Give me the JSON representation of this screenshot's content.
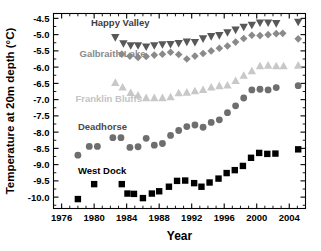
{
  "chart_data": {
    "type": "scatter",
    "title": "",
    "xlabel": "Year",
    "ylabel": "Temperature at 20m depth (°C)",
    "xlim": [
      1975.0,
      2006.0
    ],
    "ylim": [
      -10.35,
      -4.35
    ],
    "xticks": [
      1976,
      1980,
      1984,
      1988,
      1992,
      1996,
      2000,
      2004
    ],
    "yticks": [
      -4.5,
      -5.0,
      -5.5,
      -6.0,
      -6.5,
      -7.0,
      -7.5,
      -8.0,
      -8.5,
      -9.0,
      -9.5,
      -10.0
    ],
    "xtick_labels": [
      "1976",
      "1980",
      "1984",
      "1988",
      "1992",
      "1996",
      "2000",
      "2004"
    ],
    "ytick_labels": [
      "-4.5",
      "-5.0",
      "-5.5",
      "-6.0",
      "-6.5",
      "-7.0",
      "-7.5",
      "-8.0",
      "-8.5",
      "-9.0",
      "-9.5",
      "-10.0"
    ],
    "grid": false,
    "legend_position": "inline-annotations",
    "minor_ticks": true,
    "series": [
      {
        "name": "Happy Valley",
        "marker": "triangle-down",
        "color": "#585858",
        "label_color": "#404040",
        "label_x": 1979.6,
        "label_y": -4.72,
        "points": [
          [
            1982.6,
            -5.08
          ],
          [
            1983.6,
            -5.27
          ],
          [
            1984.5,
            -5.33
          ],
          [
            1985.4,
            -5.33
          ],
          [
            1986.4,
            -5.37
          ],
          [
            1987.4,
            -5.33
          ],
          [
            1988.4,
            -5.3
          ],
          [
            1989.4,
            -5.29
          ],
          [
            1990.4,
            -5.26
          ],
          [
            1991.4,
            -5.22
          ],
          [
            1992.4,
            -5.23
          ],
          [
            1993.4,
            -5.12
          ],
          [
            1994.4,
            -5.05
          ],
          [
            1995.4,
            -5.02
          ],
          [
            1996.4,
            -4.93
          ],
          [
            1997.4,
            -4.85
          ],
          [
            1998.4,
            -4.76
          ],
          [
            1999.4,
            -4.7
          ],
          [
            2000.4,
            -4.63
          ],
          [
            2001.4,
            -4.63
          ],
          [
            2002.4,
            -4.65
          ],
          [
            2005.1,
            -4.61
          ]
        ]
      },
      {
        "name": "Galbraith Lake",
        "marker": "diamond",
        "color": "#8a8a8a",
        "label_color": "#8a8a8a",
        "label_x": 1978.2,
        "label_y": -5.7,
        "points": [
          [
            1983.4,
            -5.6
          ],
          [
            1984.4,
            -5.66
          ],
          [
            1985.4,
            -5.7
          ],
          [
            1986.4,
            -5.67
          ],
          [
            1987.4,
            -5.63
          ],
          [
            1988.4,
            -5.6
          ],
          [
            1989.4,
            -5.54
          ],
          [
            1990.4,
            -5.61
          ],
          [
            1991.4,
            -5.75
          ],
          [
            1992.4,
            -5.66
          ],
          [
            1993.4,
            -5.58
          ],
          [
            1994.4,
            -5.5
          ],
          [
            1995.4,
            -5.42
          ],
          [
            1996.4,
            -5.35
          ],
          [
            1997.4,
            -5.23
          ],
          [
            1998.4,
            -5.12
          ],
          [
            1999.4,
            -5.02
          ],
          [
            2000.4,
            -5.03
          ],
          [
            2001.4,
            -5.0
          ],
          [
            2002.4,
            -4.97
          ],
          [
            2003.2,
            -4.96
          ],
          [
            2005.1,
            -5.13
          ]
        ]
      },
      {
        "name": "Franklin Bluffs",
        "marker": "triangle-up",
        "color": "#c8c8c8",
        "label_color": "#c4c4c4",
        "label_x": 1977.7,
        "label_y": -7.08,
        "points": [
          [
            1982.6,
            -6.48
          ],
          [
            1983.5,
            -6.62
          ],
          [
            1984.5,
            -6.79
          ],
          [
            1985.4,
            -6.87
          ],
          [
            1986.4,
            -6.95
          ],
          [
            1987.4,
            -6.95
          ],
          [
            1988.4,
            -6.95
          ],
          [
            1989.4,
            -6.92
          ],
          [
            1990.4,
            -6.8
          ],
          [
            1991.4,
            -6.78
          ],
          [
            1992.4,
            -6.74
          ],
          [
            1993.4,
            -6.7
          ],
          [
            1994.4,
            -6.62
          ],
          [
            1995.4,
            -6.58
          ],
          [
            1996.4,
            -6.56
          ],
          [
            1997.4,
            -6.42
          ],
          [
            1998.4,
            -6.26
          ],
          [
            1999.4,
            -6.12
          ],
          [
            2000.4,
            -5.97
          ],
          [
            2001.4,
            -5.95
          ],
          [
            2002.4,
            -5.97
          ],
          [
            2003.3,
            -5.97
          ],
          [
            2005.1,
            -5.95
          ]
        ]
      },
      {
        "name": "Deadhorse",
        "marker": "circle",
        "color": "#6e6e6e",
        "label_color": "#4a4a4a",
        "label_x": 1978.0,
        "label_y": -7.93,
        "points": [
          [
            1978.0,
            -8.71
          ],
          [
            1979.4,
            -8.44
          ],
          [
            1980.4,
            -8.44
          ],
          [
            1982.3,
            -8.17
          ],
          [
            1983.3,
            -8.17
          ],
          [
            1984.4,
            -8.47
          ],
          [
            1985.4,
            -8.45
          ],
          [
            1986.4,
            -8.19
          ],
          [
            1987.4,
            -8.4
          ],
          [
            1988.4,
            -8.35
          ],
          [
            1989.4,
            -8.1
          ],
          [
            1990.4,
            -7.95
          ],
          [
            1991.4,
            -7.83
          ],
          [
            1992.4,
            -7.78
          ],
          [
            1993.4,
            -7.85
          ],
          [
            1994.4,
            -7.7
          ],
          [
            1995.4,
            -7.62
          ],
          [
            1996.4,
            -7.4
          ],
          [
            1997.4,
            -7.19
          ],
          [
            1998.4,
            -6.95
          ],
          [
            1999.4,
            -6.7
          ],
          [
            2000.4,
            -6.68
          ],
          [
            2001.4,
            -6.7
          ],
          [
            2002.4,
            -6.63
          ],
          [
            2005.1,
            -6.57
          ]
        ]
      },
      {
        "name": "West Dock",
        "marker": "square",
        "color": "#000000",
        "label_color": "#000000",
        "label_x": 1978.0,
        "label_y": -9.28,
        "points": [
          [
            1978.0,
            -10.06
          ],
          [
            1980.0,
            -9.6
          ],
          [
            1983.4,
            -9.6
          ],
          [
            1984.1,
            -9.89
          ],
          [
            1984.9,
            -9.9
          ],
          [
            1986.0,
            -10.03
          ],
          [
            1987.1,
            -9.89
          ],
          [
            1988.0,
            -9.82
          ],
          [
            1989.2,
            -9.68
          ],
          [
            1990.2,
            -9.5
          ],
          [
            1991.2,
            -9.49
          ],
          [
            1992.3,
            -9.57
          ],
          [
            1993.2,
            -9.68
          ],
          [
            1994.2,
            -9.55
          ],
          [
            1995.3,
            -9.43
          ],
          [
            1996.3,
            -9.26
          ],
          [
            1997.3,
            -9.17
          ],
          [
            1998.3,
            -9.04
          ],
          [
            1999.3,
            -8.79
          ],
          [
            2000.3,
            -8.64
          ],
          [
            2001.3,
            -8.67
          ],
          [
            2002.3,
            -8.66
          ],
          [
            2005.1,
            -8.53
          ]
        ]
      }
    ]
  }
}
